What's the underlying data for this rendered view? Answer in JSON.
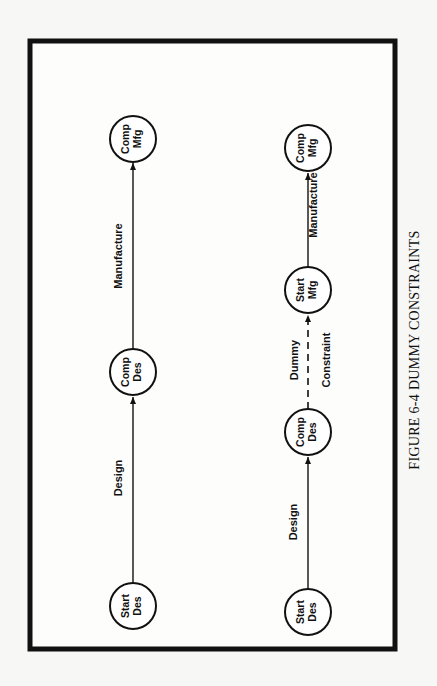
{
  "figure": {
    "caption": "FIGURE 6-4 DUMMY CONSTRAINTS",
    "colors": {
      "ink": "#111111",
      "paper": "#f7f7f5"
    }
  },
  "network_a": {
    "nodes": [
      {
        "id": "start_des",
        "line1": "Start",
        "line2": "Des"
      },
      {
        "id": "comp_des",
        "line1": "Comp",
        "line2": "Des"
      },
      {
        "id": "comp_mfg",
        "line1": "Comp",
        "line2": "Mfg"
      }
    ],
    "edges": [
      {
        "from": "start_des",
        "to": "comp_des",
        "label": "Design",
        "style": "solid"
      },
      {
        "from": "comp_des",
        "to": "comp_mfg",
        "label": "Manufacture",
        "style": "solid"
      }
    ]
  },
  "network_b": {
    "nodes": [
      {
        "id": "start_des",
        "line1": "Start",
        "line2": "Des"
      },
      {
        "id": "comp_des",
        "line1": "Comp",
        "line2": "Des"
      },
      {
        "id": "start_mfg",
        "line1": "Start",
        "line2": "Mfg"
      },
      {
        "id": "comp_mfg",
        "line1": "Comp",
        "line2": "Mfg"
      }
    ],
    "edges": [
      {
        "from": "start_des",
        "to": "comp_des",
        "label": "Design",
        "style": "solid"
      },
      {
        "from": "comp_des",
        "to": "start_mfg",
        "label_line1": "Dummy",
        "label_line2": "Constraint",
        "style": "dashed"
      },
      {
        "from": "start_mfg",
        "to": "comp_mfg",
        "label": "Manufacture",
        "style": "solid"
      }
    ]
  }
}
